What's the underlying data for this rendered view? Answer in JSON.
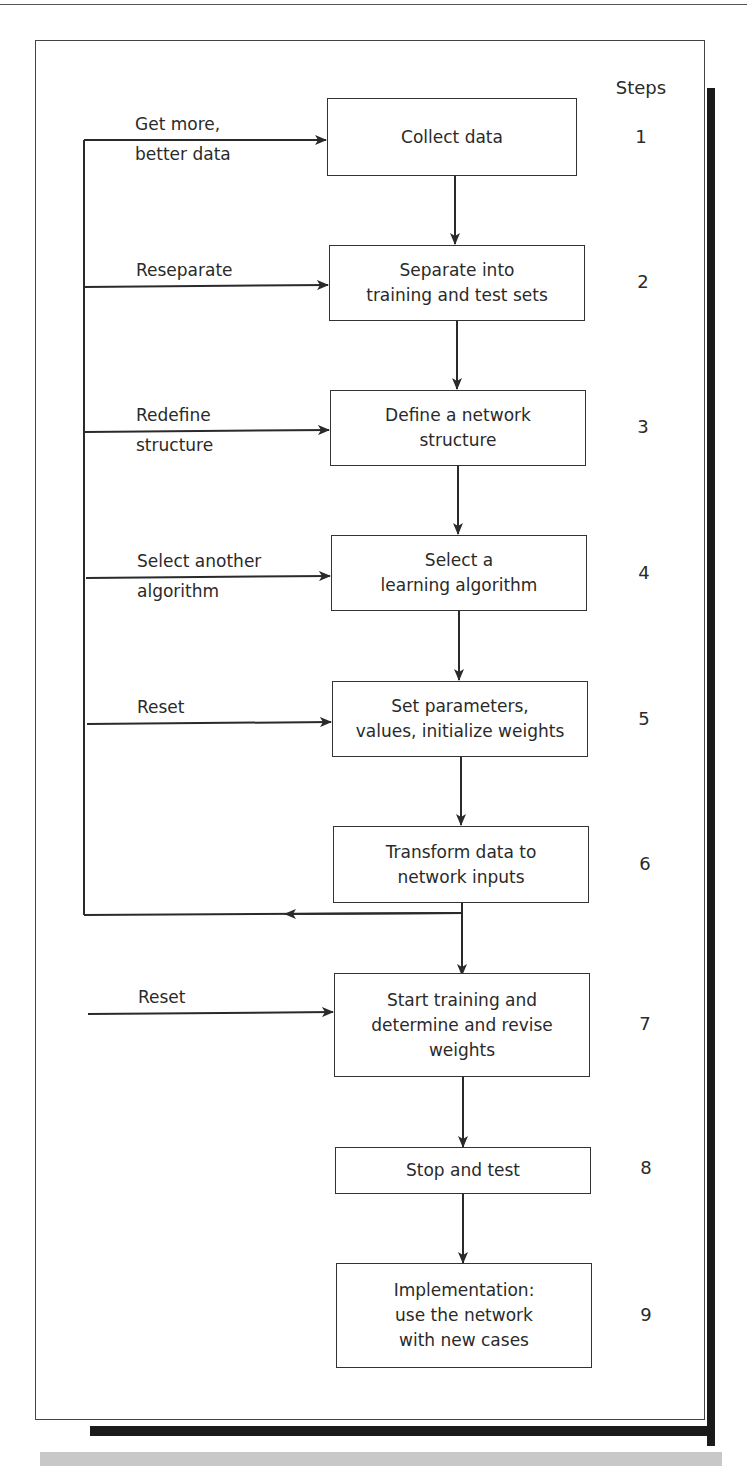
{
  "diagram": {
    "steps_header": "Steps",
    "steps": [
      {
        "number": "1",
        "text": "Collect data"
      },
      {
        "number": "2",
        "text": "Separate into\ntraining and test sets"
      },
      {
        "number": "3",
        "text": "Define a network\nstructure"
      },
      {
        "number": "4",
        "text": "Select a\nlearning algorithm"
      },
      {
        "number": "5",
        "text": "Set parameters,\nvalues, initialize weights"
      },
      {
        "number": "6",
        "text": "Transform data to\nnetwork inputs"
      },
      {
        "number": "7",
        "text": "Start training and\ndetermine and revise\nweights"
      },
      {
        "number": "8",
        "text": "Stop and test"
      },
      {
        "number": "9",
        "text": "Implementation:\nuse the network\nwith new cases"
      }
    ],
    "feedback_labels": [
      {
        "target_step": "1",
        "text": "Get more,\nbetter data"
      },
      {
        "target_step": "2",
        "text": "Reseparate"
      },
      {
        "target_step": "3",
        "text": "Redefine\nstructure"
      },
      {
        "target_step": "4",
        "text": "Select another\nalgorithm"
      },
      {
        "target_step": "5",
        "text": "Reset"
      },
      {
        "target_step": "7",
        "text": "Reset"
      }
    ],
    "colors": {
      "line": "#2a2a2a",
      "shadow": "#1a1a1a",
      "band": "#c8c8c8"
    }
  }
}
